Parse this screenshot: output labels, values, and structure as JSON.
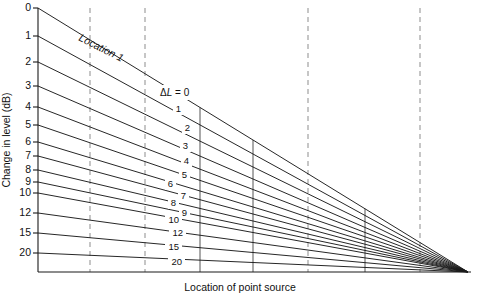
{
  "chart_data": {
    "type": "line",
    "title": "",
    "xlabel": "Location of point source",
    "ylabel": "Change in level (dB)",
    "grid": true,
    "legend": "inline-labels",
    "xlim": [
      0,
      8
    ],
    "ylim_labels": [
      "0",
      "1",
      "2",
      "3",
      "4",
      "5",
      "6",
      "7",
      "8",
      "9",
      "10",
      "12",
      "15",
      "20"
    ],
    "y_tick_labels": [
      "0",
      "1",
      "2",
      "3",
      "4",
      "5",
      "6",
      "7",
      "8",
      "9",
      "10",
      "12",
      "15",
      "20"
    ],
    "y_tick_pixels": [
      8,
      36,
      62,
      86,
      107,
      125,
      142,
      156,
      170,
      182,
      193,
      213,
      233,
      253
    ],
    "x_tick_count": 9,
    "x_tick_pixels": [
      38,
      90,
      145,
      200,
      253,
      308,
      365,
      420,
      468
    ],
    "dashed_x_ticks": [
      90,
      145,
      308,
      420
    ],
    "convergence_point": [
      468,
      272
    ],
    "series": [
      {
        "name": "0",
        "label": "ΔL = 0",
        "y_start_px": 8,
        "is_top": true
      },
      {
        "name": "1",
        "label": "1",
        "y_start_px": 36
      },
      {
        "name": "2",
        "label": "2",
        "y_start_px": 62
      },
      {
        "name": "3",
        "label": "3",
        "y_start_px": 86
      },
      {
        "name": "4",
        "label": "4",
        "y_start_px": 107
      },
      {
        "name": "5",
        "label": "5",
        "y_start_px": 125
      },
      {
        "name": "6",
        "label": "6",
        "y_start_px": 142
      },
      {
        "name": "7",
        "label": "7",
        "y_start_px": 156
      },
      {
        "name": "8",
        "label": "8",
        "y_start_px": 170
      },
      {
        "name": "9",
        "label": "9",
        "y_start_px": 182
      },
      {
        "name": "10",
        "label": "10",
        "y_start_px": 193
      },
      {
        "name": "12",
        "label": "12",
        "y_start_px": 213
      },
      {
        "name": "15",
        "label": "15",
        "y_start_px": 233
      },
      {
        "name": "20",
        "label": "20",
        "y_start_px": 253
      }
    ],
    "annotations": [
      {
        "name": "location-1",
        "text": "Location 1",
        "rotation_deg": 27
      },
      {
        "name": "delta-l-zero",
        "text": "ΔL = 0"
      }
    ]
  },
  "labels": {
    "y_axis_title": "Change in level (dB)",
    "x_axis_title": "Location of point source",
    "location_annotation": "Location 1",
    "delta_l_annotation": "ΔL = 0",
    "delta_symbol": "Δ",
    "delta_l_italic": "L",
    "delta_l_equals": " = 0"
  },
  "colors": {
    "background": "#ffffff",
    "line": "#1a1a1a",
    "dashed_grid": "#8d8d8d",
    "solid_grid": "#2a2a2a",
    "text": "#111111"
  },
  "y_ticks": [
    {
      "label": "0",
      "y": 8
    },
    {
      "label": "1",
      "y": 36
    },
    {
      "label": "2",
      "y": 62
    },
    {
      "label": "3",
      "y": 86
    },
    {
      "label": "4",
      "y": 107
    },
    {
      "label": "5",
      "y": 125
    },
    {
      "label": "6",
      "y": 142
    },
    {
      "label": "7",
      "y": 156
    },
    {
      "label": "8",
      "y": 170
    },
    {
      "label": "9",
      "y": 182
    },
    {
      "label": "10",
      "y": 193
    },
    {
      "label": "12",
      "y": 213
    },
    {
      "label": "15",
      "y": 233
    },
    {
      "label": "20",
      "y": 253
    }
  ],
  "curve_labels": [
    {
      "label": "1",
      "x": 181,
      "y": 109
    },
    {
      "label": "2",
      "x": 190,
      "y": 128
    },
    {
      "label": "3",
      "x": 188,
      "y": 146
    },
    {
      "label": "4",
      "x": 189,
      "y": 161
    },
    {
      "label": "5",
      "x": 187,
      "y": 175
    },
    {
      "label": "6",
      "x": 173,
      "y": 184
    },
    {
      "label": "7",
      "x": 186,
      "y": 196
    },
    {
      "label": "8",
      "x": 176,
      "y": 203
    },
    {
      "label": "9",
      "x": 187,
      "y": 213
    },
    {
      "label": "10",
      "x": 179,
      "y": 220
    },
    {
      "label": "12",
      "x": 183,
      "y": 233
    },
    {
      "label": "15",
      "x": 179,
      "y": 247
    },
    {
      "label": "20",
      "x": 182,
      "y": 262
    }
  ]
}
